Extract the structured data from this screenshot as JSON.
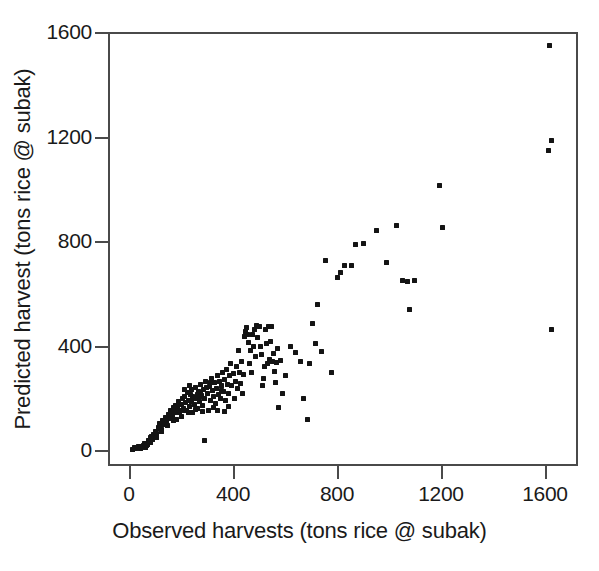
{
  "chart_data": {
    "type": "scatter",
    "title": "",
    "xlabel": "Observed harvests (tons rice @ subak)",
    "ylabel": "Predicted harvest (tons rice @ subak)",
    "xlim": [
      -60,
      1720
    ],
    "ylim": [
      -60,
      1660
    ],
    "xticks": [
      0,
      400,
      800,
      1200,
      1600
    ],
    "xtick_labels": [
      "0",
      "400",
      "800",
      "1200",
      "1600"
    ],
    "yticks": [
      0,
      400,
      800,
      1200,
      1600
    ],
    "ytick_labels": [
      "0",
      "400",
      "800",
      "1200",
      "1600"
    ],
    "grid": false,
    "legend": null,
    "marker": "square",
    "marker_color": "#141414",
    "marker_size_px": 5,
    "frame_color": "#4a4a4a",
    "background": "#ffffff",
    "series": [
      {
        "name": "subak harvests",
        "points": [
          [
            20,
            8
          ],
          [
            30,
            10
          ],
          [
            38,
            12
          ],
          [
            48,
            14
          ],
          [
            55,
            18
          ],
          [
            62,
            10
          ],
          [
            70,
            22
          ],
          [
            78,
            30
          ],
          [
            84,
            46
          ],
          [
            90,
            40
          ],
          [
            96,
            58
          ],
          [
            100,
            72
          ],
          [
            106,
            62
          ],
          [
            112,
            88
          ],
          [
            118,
            100
          ],
          [
            124,
            78
          ],
          [
            128,
            112
          ],
          [
            134,
            96
          ],
          [
            140,
            124
          ],
          [
            146,
            108
          ],
          [
            150,
            136
          ],
          [
            156,
            120
          ],
          [
            160,
            150
          ],
          [
            166,
            132
          ],
          [
            170,
            164
          ],
          [
            176,
            144
          ],
          [
            180,
            172
          ],
          [
            184,
            118
          ],
          [
            188,
            158
          ],
          [
            192,
            186
          ],
          [
            196,
            142
          ],
          [
            200,
            176
          ],
          [
            204,
            196
          ],
          [
            208,
            160
          ],
          [
            212,
            206
          ],
          [
            216,
            180
          ],
          [
            220,
            150
          ],
          [
            224,
            222
          ],
          [
            228,
            190
          ],
          [
            232,
            168
          ],
          [
            236,
            212
          ],
          [
            240,
            232
          ],
          [
            244,
            144
          ],
          [
            248,
            200
          ],
          [
            252,
            176
          ],
          [
            256,
            238
          ],
          [
            260,
            196
          ],
          [
            264,
            160
          ],
          [
            268,
            224
          ],
          [
            272,
            186
          ],
          [
            276,
            250
          ],
          [
            280,
            208
          ],
          [
            284,
            172
          ],
          [
            288,
            232
          ],
          [
            292,
            196
          ],
          [
            296,
            262
          ],
          [
            300,
            218
          ],
          [
            304,
            150
          ],
          [
            308,
            244
          ],
          [
            312,
            190
          ],
          [
            316,
            272
          ],
          [
            320,
            226
          ],
          [
            324,
            206
          ],
          [
            328,
            258
          ],
          [
            332,
            178
          ],
          [
            336,
            236
          ],
          [
            340,
            284
          ],
          [
            344,
            214
          ],
          [
            348,
            264
          ],
          [
            352,
            196
          ],
          [
            356,
            246
          ],
          [
            360,
            296
          ],
          [
            364,
            224
          ],
          [
            368,
            268
          ],
          [
            372,
            188
          ],
          [
            376,
            308
          ],
          [
            380,
            252
          ],
          [
            384,
            216
          ],
          [
            388,
            284
          ],
          [
            392,
            330
          ],
          [
            396,
            246
          ],
          [
            400,
            292
          ],
          [
            404,
            196
          ],
          [
            408,
            264
          ],
          [
            412,
            320
          ],
          [
            416,
            236
          ],
          [
            420,
            380
          ],
          [
            424,
            298
          ],
          [
            428,
            256
          ],
          [
            432,
            340
          ],
          [
            436,
            216
          ],
          [
            440,
            288
          ],
          [
            444,
            436
          ],
          [
            448,
            452
          ],
          [
            452,
            470
          ],
          [
            456,
            444
          ],
          [
            460,
            410
          ],
          [
            464,
            330
          ],
          [
            468,
            382
          ],
          [
            472,
            296
          ],
          [
            476,
            444
          ],
          [
            480,
            398
          ],
          [
            484,
            460
          ],
          [
            488,
            356
          ],
          [
            492,
            476
          ],
          [
            496,
            432
          ],
          [
            500,
            472
          ],
          [
            504,
            398
          ],
          [
            508,
            366
          ],
          [
            512,
            246
          ],
          [
            516,
            272
          ],
          [
            520,
            318
          ],
          [
            524,
            460
          ],
          [
            528,
            408
          ],
          [
            532,
            330
          ],
          [
            536,
            474
          ],
          [
            540,
            348
          ],
          [
            544,
            416
          ],
          [
            548,
            472
          ],
          [
            552,
            340
          ],
          [
            556,
            368
          ],
          [
            560,
            300
          ],
          [
            564,
            260
          ],
          [
            568,
            336
          ],
          [
            572,
            388
          ],
          [
            576,
            164
          ],
          [
            584,
            344
          ],
          [
            592,
            218
          ],
          [
            600,
            286
          ],
          [
            620,
            398
          ],
          [
            640,
            372
          ],
          [
            660,
            340
          ],
          [
            670,
            196
          ],
          [
            686,
            116
          ],
          [
            696,
            330
          ],
          [
            706,
            486
          ],
          [
            716,
            406
          ],
          [
            724,
            556
          ],
          [
            740,
            376
          ],
          [
            756,
            726
          ],
          [
            780,
            296
          ],
          [
            800,
            662
          ],
          [
            812,
            680
          ],
          [
            830,
            706
          ],
          [
            856,
            708
          ],
          [
            872,
            788
          ],
          [
            900,
            790
          ],
          [
            950,
            840
          ],
          [
            990,
            716
          ],
          [
            1030,
            858
          ],
          [
            1050,
            648
          ],
          [
            1070,
            646
          ],
          [
            1080,
            538
          ],
          [
            1098,
            650
          ],
          [
            1196,
            1012
          ],
          [
            1204,
            852
          ],
          [
            1616,
            1548
          ],
          [
            1626,
            1186
          ],
          [
            1614,
            1148
          ],
          [
            1626,
            462
          ],
          [
            60,
            24
          ],
          [
            74,
            36
          ],
          [
            88,
            52
          ],
          [
            102,
            66
          ],
          [
            116,
            84
          ],
          [
            130,
            104
          ],
          [
            144,
            118
          ],
          [
            158,
            134
          ],
          [
            172,
            148
          ],
          [
            186,
            166
          ],
          [
            200,
            128
          ],
          [
            214,
            152
          ],
          [
            228,
            144
          ],
          [
            242,
            184
          ],
          [
            256,
            156
          ],
          [
            270,
            204
          ],
          [
            284,
            148
          ],
          [
            298,
            240
          ],
          [
            312,
            258
          ],
          [
            326,
            164
          ],
          [
            340,
            150
          ],
          [
            354,
            228
          ],
          [
            368,
            146
          ],
          [
            382,
            168
          ],
          [
            290,
            36
          ],
          [
            246,
            206
          ],
          [
            262,
            214
          ],
          [
            276,
            222
          ],
          [
            214,
            232
          ],
          [
            232,
            248
          ],
          [
            196,
            152
          ],
          [
            170,
            112
          ],
          [
            148,
            92
          ],
          [
            126,
            70
          ],
          [
            104,
            48
          ],
          [
            84,
            28
          ],
          [
            66,
            16
          ],
          [
            44,
            6
          ],
          [
            26,
            4
          ],
          [
            14,
            2
          ]
        ]
      }
    ]
  },
  "axes": {
    "x": {
      "title": "Observed harvests (tons rice @ subak)",
      "tick_labels": [
        "0",
        "400",
        "800",
        "1200",
        "1600"
      ]
    },
    "y": {
      "title": "Predicted harvest (tons rice @ subak)",
      "tick_labels": [
        "0",
        "400",
        "800",
        "1200",
        "1600"
      ]
    }
  }
}
